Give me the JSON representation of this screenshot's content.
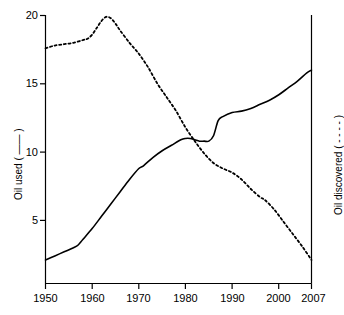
{
  "chart_data": {
    "type": "line",
    "title": "",
    "subtitle": "",
    "xlabel": "",
    "ylabel_left": "Oil used ( —— )",
    "ylabel_right": "Oil discovered ( - - - - )",
    "xlim": [
      1950,
      2007
    ],
    "ylim": [
      0,
      20
    ],
    "yticks": [
      5,
      10,
      15,
      20
    ],
    "ytick_labels": [
      "5",
      "10",
      "15",
      "20"
    ],
    "xticks": [
      1950,
      1960,
      1970,
      1980,
      1990,
      2000,
      2007
    ],
    "xtick_labels": [
      "1950",
      "1960",
      "1970",
      "1980",
      "1990",
      "2000",
      "2007"
    ],
    "grid": false,
    "legend": "axis-labels",
    "axis_color": "#000000",
    "series": [
      {
        "name": "Oil used",
        "style": "solid",
        "color": "#000000",
        "axis": "left",
        "x": [
          1950,
          1952,
          1954,
          1956,
          1957,
          1958,
          1960,
          1962,
          1964,
          1966,
          1968,
          1970,
          1971,
          1973,
          1975,
          1977,
          1979,
          1980,
          1981,
          1982,
          1983,
          1984,
          1985,
          1986,
          1987,
          1988,
          1990,
          1992,
          1994,
          1996,
          1998,
          2000,
          2002,
          2004,
          2006,
          2007
        ],
        "values": [
          2.1,
          2.4,
          2.7,
          3.0,
          3.2,
          3.6,
          4.4,
          5.3,
          6.2,
          7.1,
          8.0,
          8.8,
          9.0,
          9.6,
          10.1,
          10.5,
          10.9,
          11.0,
          11.0,
          10.9,
          10.8,
          10.8,
          10.8,
          11.2,
          12.3,
          12.6,
          12.9,
          13.0,
          13.2,
          13.5,
          13.8,
          14.2,
          14.7,
          15.2,
          15.8,
          16.0
        ]
      },
      {
        "name": "Oil discovered",
        "style": "dotted",
        "color": "#000000",
        "axis": "right",
        "x": [
          1950,
          1952,
          1954,
          1956,
          1958,
          1959,
          1960,
          1961,
          1962,
          1963,
          1964,
          1965,
          1966,
          1968,
          1970,
          1972,
          1974,
          1976,
          1978,
          1980,
          1982,
          1984,
          1986,
          1988,
          1990,
          1992,
          1994,
          1996,
          1997,
          1999,
          2001,
          2003,
          2005,
          2007
        ],
        "values": [
          17.6,
          17.8,
          17.9,
          18.0,
          18.2,
          18.3,
          18.6,
          19.1,
          19.6,
          19.9,
          19.8,
          19.4,
          18.9,
          18.0,
          17.2,
          16.2,
          15.0,
          14.0,
          13.0,
          11.8,
          10.8,
          9.9,
          9.2,
          8.8,
          8.5,
          8.0,
          7.3,
          6.7,
          6.5,
          5.8,
          4.9,
          4.0,
          3.1,
          2.1
        ]
      }
    ]
  },
  "axes": {
    "left_title": "Oil used ( —— )",
    "right_title": "Oil discovered ( - - - - )"
  }
}
